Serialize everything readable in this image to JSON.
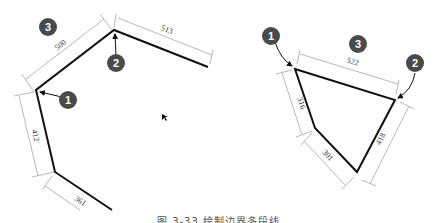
{
  "figure": {
    "caption": "图 3-33  绘制边界多段线",
    "left_diagram": {
      "callouts": [
        {
          "id": "callout-3",
          "label": "3"
        },
        {
          "id": "callout-2",
          "label": "2"
        },
        {
          "id": "callout-1",
          "label": "1"
        }
      ],
      "dimensions": [
        {
          "label": "500"
        },
        {
          "label": "513"
        },
        {
          "label": "412"
        },
        {
          "label": "361"
        }
      ]
    },
    "right_diagram": {
      "callouts": [
        {
          "id": "callout-1",
          "label": "1"
        },
        {
          "id": "callout-3",
          "label": "3"
        },
        {
          "id": "callout-2",
          "label": "2"
        }
      ],
      "dimensions": [
        {
          "label": "522"
        },
        {
          "label": "316"
        },
        {
          "label": "301"
        },
        {
          "label": "418"
        }
      ]
    },
    "colors": {
      "line": "#111111",
      "dimension": "#999999",
      "callout_fill": "#4a4a4a",
      "callout_text": "#ffffff"
    }
  }
}
